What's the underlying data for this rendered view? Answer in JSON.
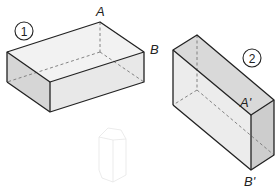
{
  "figure1": {
    "number": "1",
    "label_A": "A",
    "label_B": "B"
  },
  "figure2": {
    "number": "2",
    "label_A": "A'",
    "label_B": "B'"
  },
  "colors": {
    "stroke": "#222222",
    "top_face": "#f2f2f2",
    "front_face": "#e4e4e4",
    "side_face": "#cfcfcf",
    "hidden_edge": "#777777"
  }
}
